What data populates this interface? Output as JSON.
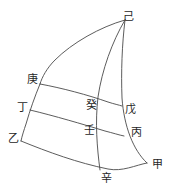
{
  "figure": {
    "background_color": "#ffffff",
    "stroke_color": "#4a4a4a",
    "label_color": "#262626",
    "width": 171,
    "height": 193
  },
  "labels": [
    {
      "id": "ji",
      "text": "己",
      "x": 128,
      "y": 16,
      "role": "apex-vertex"
    },
    {
      "id": "geng",
      "text": "庚",
      "x": 32,
      "y": 79,
      "role": "left-edge-vertex"
    },
    {
      "id": "ding",
      "text": "丁",
      "x": 22,
      "y": 107,
      "role": "left-edge-vertex"
    },
    {
      "id": "yi",
      "text": "乙",
      "x": 13,
      "y": 138,
      "role": "left-edge-vertex"
    },
    {
      "id": "gui",
      "text": "癸",
      "x": 91,
      "y": 105,
      "role": "interior-node"
    },
    {
      "id": "ren",
      "text": "壬",
      "x": 89,
      "y": 130,
      "role": "interior-node"
    },
    {
      "id": "wu",
      "text": "戊",
      "x": 130,
      "y": 109,
      "role": "right-edge-vertex"
    },
    {
      "id": "bing",
      "text": "丙",
      "x": 136,
      "y": 132,
      "role": "right-edge-vertex"
    },
    {
      "id": "jia",
      "text": "甲",
      "x": 157,
      "y": 164,
      "role": "corner-vertex"
    },
    {
      "id": "xin",
      "text": "辛",
      "x": 106,
      "y": 178,
      "role": "bottom-node"
    }
  ],
  "curves": [
    {
      "id": "outer-left-arc",
      "desc": "Large outer arc from apex 己 sweeping left and down to 庚",
      "d": "M 125,20 C 100,27 72,43 55,60 C 47,68 42,77 40,84"
    },
    {
      "id": "left-edge-curve",
      "desc": "Left boundary curve through 庚, 丁, 乙",
      "d": "M 40,84 C 35,96 30,110 26,124 C 24,130 22,136 21,141"
    },
    {
      "id": "middle-curve",
      "desc": "Inner meridian curve from apex 己 through 癸, 壬 down to 辛",
      "d": "M 125,20 C 112,42 102,70 98,97 C 95,122 97,148 100,170"
    },
    {
      "id": "right-edge-curve",
      "desc": "Right boundary curve from apex 己 through 戊, 丙 to 甲",
      "d": "M 125,20 C 122,45 121,72 122,98 C 124,126 133,150 147,163"
    },
    {
      "id": "arc-upper",
      "desc": "Upper transverse arc from 庚 across 癸 to 戊",
      "d": "M 40,84 C 62,88 88,95 108,102 C 114,104 119,105 122,106"
    },
    {
      "id": "arc-middle",
      "desc": "Middle transverse arc from 丁 across 壬 to 丙",
      "d": "M 30,110 C 55,116 82,124 105,131 C 113,133 119,135 124,136"
    },
    {
      "id": "arc-lower",
      "desc": "Lower transverse arc from 乙 across 辛 to 甲",
      "d": "M 21,141 C 48,152 78,163 108,169 C 122,172 136,165 147,163"
    }
  ]
}
